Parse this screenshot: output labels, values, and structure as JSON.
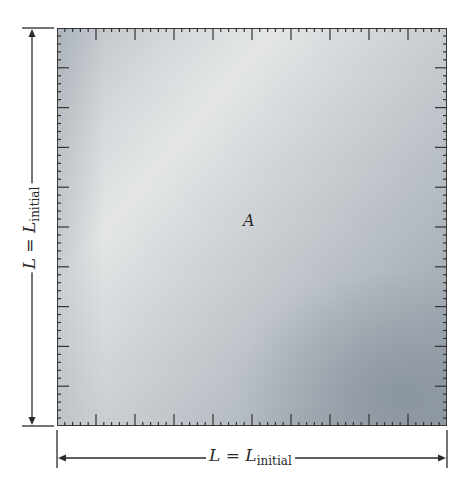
{
  "diagram": {
    "region_label": "A",
    "width_dimension": {
      "symbol": "L",
      "equals": "=",
      "symbol2": "L",
      "subscript": "initial"
    },
    "height_dimension": {
      "symbol": "L",
      "equals": "=",
      "symbol2": "L",
      "subscript": "initial"
    },
    "ruler": {
      "major_divisions": 10,
      "minor_per_major": 5
    },
    "colors": {
      "sheet_light": "#e4e6e6",
      "sheet_dark": "#9aa3ab",
      "ink": "#2a2a2a",
      "border": "#3a3a3a"
    }
  }
}
